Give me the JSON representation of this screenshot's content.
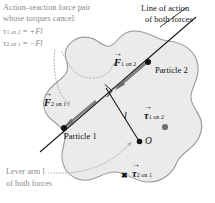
{
  "figure": {
    "type": "physics-diagram",
    "background_color": "#ffffff",
    "body": {
      "name": "rigid-body-blob",
      "fill_color": "#ebebeb",
      "stroke_color": "#9a9a9a"
    }
  },
  "annotations": {
    "top_left": {
      "line1": "Action–reaction force pair",
      "line2": "whose torques cancel:",
      "color": "#8a8a8a"
    },
    "equations": [
      {
        "name": "torque-1-on-2",
        "symbol": "τ",
        "subscript": "1 on 2",
        "relation": "=",
        "value": "+Fl"
      },
      {
        "name": "torque-2-on-1",
        "symbol": "τ",
        "subscript": "2 on 1",
        "relation": "=",
        "value": "−Fl"
      }
    ],
    "top_right": {
      "line1": "Line of action",
      "line2": "of both forces",
      "color": "#1a1a1a"
    },
    "bottom_left": {
      "line1": "Lever arm l",
      "line2": "of both forces",
      "color": "#8a8a8a"
    }
  },
  "labels": {
    "particle_1": "Particle 1",
    "particle_2": "Particle 2",
    "origin": "O",
    "lever_arm": "l"
  },
  "vectors": [
    {
      "name": "force-1-on-2",
      "symbol": "F",
      "subscript": "1 on 2",
      "has_arrow_hat": true,
      "direction": "up-right along line of action"
    },
    {
      "name": "force-2-on-1",
      "symbol": "F",
      "subscript": "2 on 1",
      "has_arrow_hat": true,
      "direction": "down-left along line of action"
    },
    {
      "name": "torque-1-on-2-vector",
      "symbol": "τ",
      "subscript": "1 on 2",
      "has_arrow_hat": true,
      "out_of_page_marker": "dot"
    },
    {
      "name": "torque-2-on-1-vector",
      "symbol": "τ",
      "subscript": "2 on 1",
      "has_arrow_hat": true,
      "into_page_marker": "✖"
    }
  ],
  "markers": {
    "right_angle": "right-angle square at foot of lever arm",
    "into_page_glyph": "✖"
  }
}
